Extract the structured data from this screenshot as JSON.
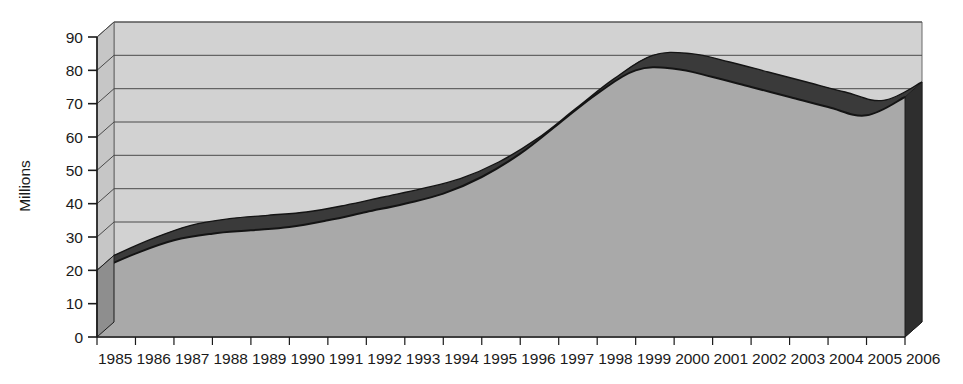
{
  "chart_data": {
    "type": "area",
    "title": "",
    "subtitle": "",
    "xlabel": "",
    "ylabel": "Millions",
    "style": "3d-area",
    "grid": true,
    "legend": "none",
    "xlim": [
      "1985",
      "2006"
    ],
    "ylim": [
      0,
      90
    ],
    "ytick_step": 10,
    "categories": [
      "1985",
      "1986",
      "1987",
      "1988",
      "1989",
      "1990",
      "1991",
      "1992",
      "1993",
      "1994",
      "1995",
      "1996",
      "1997",
      "1998",
      "1999",
      "2000",
      "2001",
      "2002",
      "2003",
      "2004",
      "2005",
      "2006"
    ],
    "values": [
      20,
      25,
      29,
      31,
      32,
      33,
      35,
      37.5,
      40,
      43,
      48,
      55,
      64,
      73,
      80,
      80.5,
      78,
      75,
      72,
      69,
      66.5,
      72
    ],
    "yticks": [
      0,
      10,
      20,
      30,
      40,
      50,
      60,
      70,
      80,
      90
    ],
    "ytick_labels": [
      "0",
      "10",
      "20",
      "30",
      "40",
      "50",
      "60",
      "70",
      "80",
      "90"
    ],
    "series": [
      {
        "name": "Millions",
        "values": [
          20,
          25,
          29,
          31,
          32,
          33,
          35,
          37.5,
          40,
          43,
          48,
          55,
          64,
          73,
          80,
          80.5,
          78,
          75,
          72,
          69,
          66.5,
          72
        ]
      }
    ],
    "colors": {
      "area_fill": "#a9a9a9",
      "area_side": "#2e2e2e",
      "area_top_edge": "#1c1c1c",
      "plot_background": "#d2d2d2",
      "wall_side": "#c4c4c4",
      "gridline": "#4a4a4a",
      "axis": "#1a1a1a",
      "text": "#1a1a1a",
      "page_background": "#ffffff"
    }
  }
}
